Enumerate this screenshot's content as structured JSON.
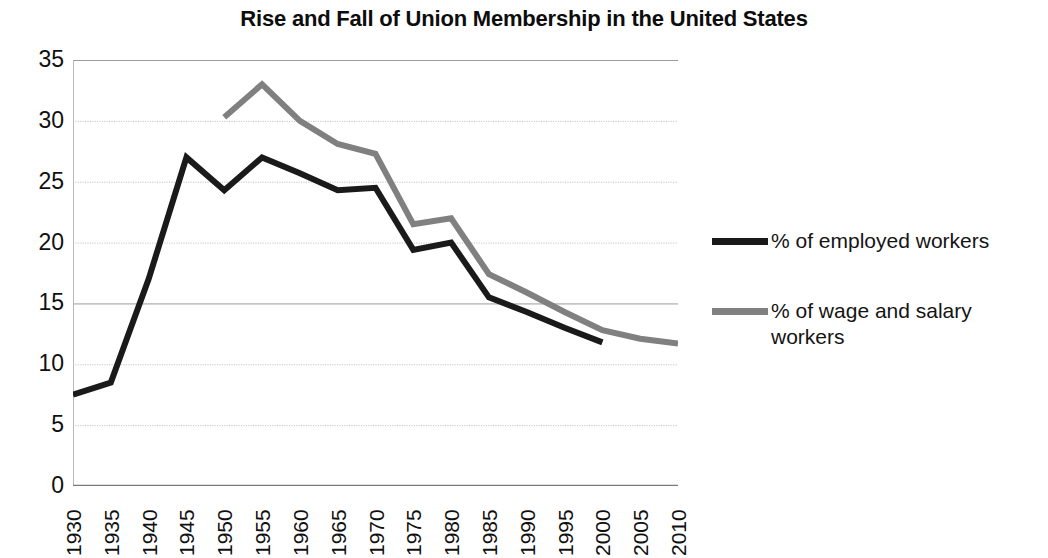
{
  "chart_data": {
    "type": "line",
    "title": "Rise and Fall of Union Membership in the United States",
    "xlabel": "",
    "ylabel": "",
    "x": [
      1930,
      1935,
      1940,
      1945,
      1950,
      1955,
      1960,
      1965,
      1970,
      1975,
      1980,
      1985,
      1990,
      1995,
      2000,
      2005,
      2010
    ],
    "xtick_labels": [
      "1930",
      "1935",
      "1940",
      "1945",
      "1950",
      "1955",
      "1960",
      "1965",
      "1970",
      "1975",
      "1980",
      "1985",
      "1990",
      "1995",
      "2000",
      "2005",
      "2010"
    ],
    "ytick_labels": [
      "35",
      "30",
      "25",
      "20",
      "15",
      "10",
      "5",
      "0"
    ],
    "ytick_values": [
      35,
      30,
      25,
      20,
      15,
      10,
      5,
      0
    ],
    "ylim": [
      0,
      35
    ],
    "xlim": [
      1930,
      2010
    ],
    "grid": true,
    "grid_axis": "y",
    "legend_position": "right",
    "series": [
      {
        "name": "% of employed workers",
        "color": "#1a1a1a",
        "x": [
          1930,
          1935,
          1940,
          1945,
          1950,
          1955,
          1960,
          1965,
          1970,
          1975,
          1980,
          1985,
          1990,
          1995,
          2000
        ],
        "values": [
          7.5,
          8.5,
          17.0,
          27.0,
          24.3,
          27.0,
          25.7,
          24.3,
          24.5,
          19.4,
          20.0,
          15.5,
          14.3,
          13.0,
          11.8
        ]
      },
      {
        "name": "% of wage and salary workers",
        "color": "#808080",
        "x": [
          1950,
          1955,
          1960,
          1965,
          1970,
          1975,
          1980,
          1985,
          1990,
          1995,
          2000,
          2005,
          2010
        ],
        "values": [
          30.3,
          33.0,
          30.0,
          28.1,
          27.3,
          21.5,
          22.0,
          17.4,
          15.9,
          14.3,
          12.8,
          12.1,
          11.7
        ]
      }
    ]
  },
  "legend": {
    "entries": [
      {
        "label": "% of employed workers",
        "color": "#1a1a1a"
      },
      {
        "label": "% of wage and salary workers",
        "color": "#808080"
      }
    ]
  }
}
